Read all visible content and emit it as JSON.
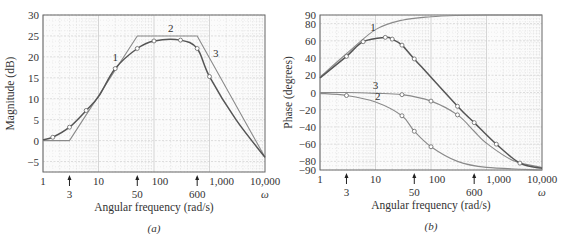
{
  "chart_data": [
    {
      "type": "line",
      "panel": "(a)",
      "title": "",
      "xlabel": "Angular frequency (rad/s)",
      "ylabel": "Magnitude (dB)",
      "xscale": "log",
      "xlim": [
        1,
        10000
      ],
      "ylim": [
        -7.5,
        30
      ],
      "x_tick_labels": [
        "1",
        "10",
        "100",
        "1,000",
        "10,000"
      ],
      "x_tick_values": [
        1,
        10,
        100,
        1000,
        10000
      ],
      "x_symbol": "ω",
      "y_tick_labels": [
        "30",
        "25",
        "20",
        "15",
        "10",
        "5",
        "0",
        "−5"
      ],
      "y_tick_values": [
        30,
        25,
        20,
        15,
        10,
        5,
        0,
        -5
      ],
      "corner_markers": [
        {
          "label": "3",
          "x": 3
        },
        {
          "label": "50",
          "x": 50
        },
        {
          "label": "600",
          "x": 600
        }
      ],
      "grid": true,
      "series": [
        {
          "name": "Asymptotic (straight-line) approximation",
          "curve_labels": [
            "1",
            "2",
            "3"
          ],
          "x": [
            1,
            3,
            50,
            600,
            10000
          ],
          "values": [
            0,
            0,
            25,
            25,
            -4
          ]
        },
        {
          "name": "Exact magnitude",
          "x": [
            1,
            1.5,
            3,
            6,
            10,
            20,
            50,
            100,
            300,
            600,
            1000,
            3000,
            10000
          ],
          "values": [
            0.2,
            0.8,
            3.2,
            7.2,
            10.5,
            17.2,
            22,
            23.8,
            24,
            22,
            15.3,
            5,
            -4
          ]
        }
      ],
      "annotations": [
        {
          "text": "1",
          "x": 20,
          "y": 19
        },
        {
          "text": "2",
          "x": 200,
          "y": 26
        },
        {
          "text": "3",
          "x": 1300,
          "y": 20
        }
      ]
    },
    {
      "type": "line",
      "panel": "(b)",
      "title": "",
      "xlabel": "Angular frequency (rad/s)",
      "ylabel": "Phase (degrees)",
      "xscale": "log",
      "xlim": [
        1,
        10000
      ],
      "ylim": [
        -90,
        90
      ],
      "x_tick_labels": [
        "1",
        "10",
        "100",
        "1,000",
        "10,000"
      ],
      "x_tick_values": [
        1,
        10,
        100,
        1000,
        10000
      ],
      "x_symbol": "ω",
      "y_tick_labels": [
        "90",
        "80",
        "60",
        "40",
        "20",
        "0",
        "−20",
        "−40",
        "−60",
        "−80",
        "−90"
      ],
      "y_tick_values": [
        90,
        80,
        60,
        40,
        20,
        0,
        -20,
        -40,
        -60,
        -80,
        -90
      ],
      "corner_markers": [
        {
          "label": "3",
          "x": 3
        },
        {
          "label": "50",
          "x": 50
        },
        {
          "label": "600",
          "x": 600
        }
      ],
      "grid": true,
      "series": [
        {
          "name": "1 (zero at 3 rad/s)",
          "x": [
            1,
            3,
            10,
            30,
            100,
            300,
            1000,
            10000
          ],
          "values": [
            18,
            45,
            73,
            84,
            88,
            89.5,
            90,
            90
          ]
        },
        {
          "name": "2 (pole at 50 rad/s)",
          "x": [
            1,
            3,
            10,
            30,
            50,
            100,
            300,
            1000,
            10000
          ],
          "values": [
            -1,
            -3.5,
            -11,
            -27,
            -45,
            -63,
            -80,
            -87,
            -90
          ]
        },
        {
          "name": "3 (pole at 600 rad/s)",
          "x": [
            1,
            3,
            10,
            30,
            100,
            300,
            600,
            1000,
            3000,
            10000
          ],
          "values": [
            0,
            0,
            -1,
            -2.5,
            -10,
            -26,
            -45,
            -59,
            -79,
            -87
          ]
        },
        {
          "name": "Total phase",
          "x": [
            1,
            3,
            6,
            15,
            20,
            30,
            50,
            300,
            600,
            1500,
            4000,
            10000
          ],
          "values": [
            17,
            42,
            59,
            64,
            62,
            55,
            39,
            -16,
            -35,
            -60,
            -82,
            -88
          ]
        }
      ],
      "annotations": [
        {
          "text": "1",
          "x": 9,
          "y": 72
        },
        {
          "text": "2",
          "x": 11,
          "y": -9
        },
        {
          "text": "3",
          "x": 10,
          "y": 4
        }
      ]
    }
  ],
  "captions": {
    "a": "(a)",
    "b": "(b)"
  }
}
